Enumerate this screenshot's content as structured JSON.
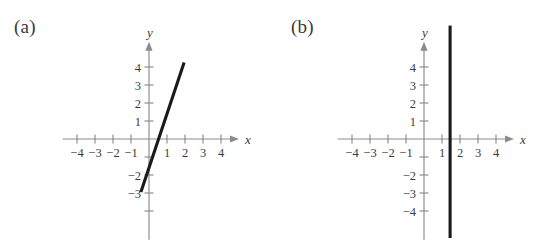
{
  "figure": {
    "background": "#ffffff",
    "axis_color": "#8b8b8b",
    "line_color": "#1a1a1a",
    "text_color": "#3b3b3b"
  },
  "panels": [
    {
      "key": "a",
      "label": "(a)",
      "label_x": 14,
      "label_y": 30,
      "origin_x": 149,
      "origin_y": 139,
      "unit": 18,
      "x_axis_label": "x",
      "y_axis_label": "y",
      "x_tick_values": [
        -4,
        -3,
        -2,
        -1,
        1,
        2,
        3,
        4
      ],
      "x_tick_labels": [
        "−4",
        "−3",
        "−2",
        "−1",
        "1",
        "2",
        "3",
        "4"
      ],
      "y_tick_values": [
        4,
        3,
        2,
        1,
        -1,
        -2,
        -3,
        -4
      ],
      "y_tick_labels": [
        "4",
        "3",
        "2",
        "1",
        "",
        "−2",
        "−3",
        ""
      ],
      "x_axis_min": -4.8,
      "x_axis_max": 5.0,
      "y_axis_min": -5.6,
      "y_axis_max": 5.4,
      "series": {
        "type": "line",
        "name": "steep-increasing-line",
        "slope": 3,
        "intercept": -1.6,
        "x_start": -0.45,
        "x_end": 1.95
      }
    },
    {
      "key": "b",
      "label": "(b)",
      "label_x": 291,
      "label_y": 30,
      "origin_x": 424,
      "origin_y": 139,
      "unit": 18,
      "x_axis_label": "x",
      "y_axis_label": "y",
      "x_tick_values": [
        -4,
        -3,
        -2,
        -1,
        1,
        2,
        3,
        4
      ],
      "x_tick_labels": [
        "−4",
        "−3",
        "−2",
        "−1",
        "1",
        "2",
        "3",
        "4"
      ],
      "y_tick_values": [
        4,
        3,
        2,
        1,
        -1,
        -2,
        -3,
        -4
      ],
      "y_tick_labels": [
        "4",
        "3",
        "2",
        "1",
        "",
        "−2",
        "−3",
        "−4"
      ],
      "x_axis_min": -4.8,
      "x_axis_max": 5.0,
      "y_axis_min": -5.6,
      "y_axis_max": 5.4,
      "series": {
        "type": "line",
        "name": "vertical-line",
        "x_constant": 1.45,
        "y_start": -5.5,
        "y_end": 6.3
      }
    }
  ],
  "chart_data": {
    "type": "line",
    "title": "",
    "xlabel": "x",
    "ylabel": "y",
    "xlim": [
      -4.8,
      5.0
    ],
    "ylim": [
      -5.6,
      5.4
    ],
    "grid": false,
    "legend": "none",
    "subplots": [
      {
        "label": "(a)",
        "description": "Steeply increasing straight line",
        "equation": "y = 3x − 1.6",
        "x": [
          -0.45,
          1.95
        ],
        "y": [
          -2.95,
          4.25
        ],
        "xticks": [
          -4,
          -3,
          -2,
          -1,
          1,
          2,
          3,
          4
        ],
        "yticks": [
          4,
          3,
          2,
          1,
          -2,
          -3
        ]
      },
      {
        "label": "(b)",
        "description": "Vertical line",
        "equation": "x = 1.45",
        "x": [
          1.45,
          1.45
        ],
        "y": [
          -5.5,
          6.3
        ],
        "xticks": [
          -4,
          -3,
          -2,
          -1,
          1,
          2,
          3,
          4
        ],
        "yticks": [
          4,
          3,
          2,
          1,
          -2,
          -3,
          -4
        ]
      }
    ]
  }
}
